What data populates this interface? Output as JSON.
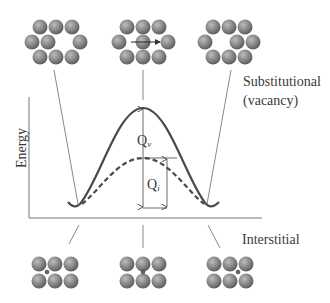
{
  "figure": {
    "y_axis_label": "Energy",
    "labels": {
      "substitutional_line1": "Substitutional",
      "substitutional_line2": "(vacancy)",
      "interstitial": "Interstitial",
      "qv_main": "Q",
      "qv_sub": "v",
      "qi_main": "Q",
      "qi_sub": "i"
    },
    "curves": [
      {
        "name": "substitutional-vacancy",
        "style": "solid",
        "barrier": "Qv"
      },
      {
        "name": "interstitial",
        "style": "dashed",
        "barrier": "Qi"
      }
    ],
    "colors": {
      "atom_fill": "#8a8a8a",
      "line": "#4a4a4a",
      "text": "#3a3a3a"
    },
    "top_row_states": [
      "initial-vacancy",
      "atom-moving-into-vacancy",
      "final-vacancy"
    ],
    "bottom_row_states": [
      "initial-interstitial",
      "interstitial-squeezing-through",
      "final-interstitial"
    ]
  }
}
